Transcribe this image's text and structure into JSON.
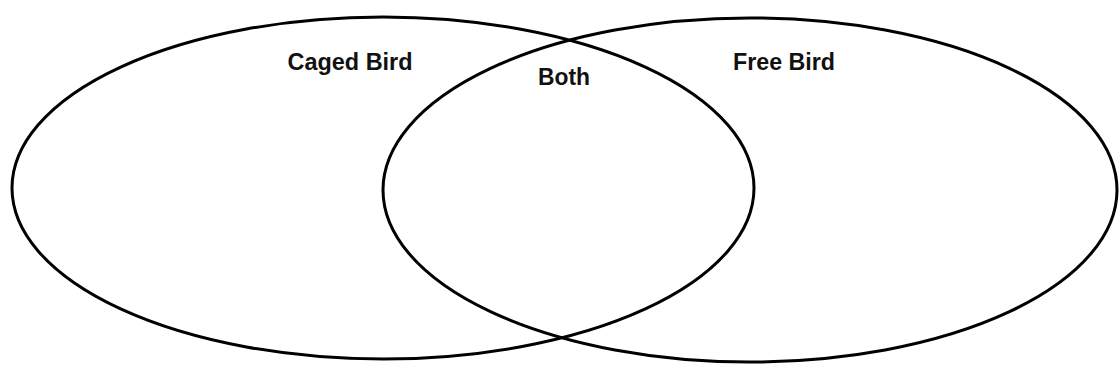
{
  "diagram": {
    "type": "venn",
    "stroke_color": "#000000",
    "background_color": "#ffffff",
    "sets": [
      {
        "id": "left",
        "label": "Caged Bird",
        "shape": {
          "cx": 383,
          "cy": 188,
          "rx": 371,
          "ry": 171
        },
        "label_pos": {
          "x": 350,
          "y": 70
        }
      },
      {
        "id": "right",
        "label": "Free Bird",
        "shape": {
          "cx": 750,
          "cy": 190,
          "rx": 367,
          "ry": 172
        },
        "label_pos": {
          "x": 784,
          "y": 70
        }
      }
    ],
    "intersection": {
      "label": "Both",
      "label_pos": {
        "x": 564,
        "y": 85
      }
    }
  }
}
